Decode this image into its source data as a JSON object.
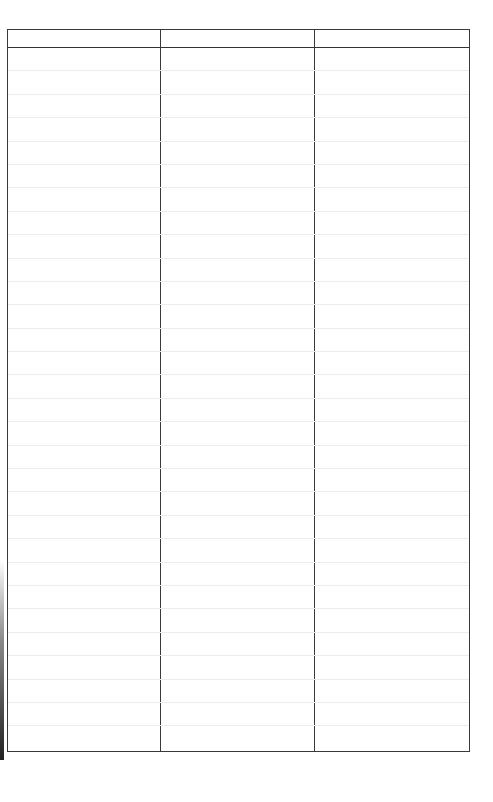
{
  "document": {
    "type": "blank ruled table form",
    "columns": [
      {
        "header": "",
        "width_px": 153
      },
      {
        "header": "",
        "width_px": 155
      },
      {
        "header": "",
        "width_px": 155
      }
    ],
    "row_count": 30,
    "rows": [
      [
        "",
        "",
        ""
      ],
      [
        "",
        "",
        ""
      ],
      [
        "",
        "",
        ""
      ],
      [
        "",
        "",
        ""
      ],
      [
        "",
        "",
        ""
      ],
      [
        "",
        "",
        ""
      ],
      [
        "",
        "",
        ""
      ],
      [
        "",
        "",
        ""
      ],
      [
        "",
        "",
        ""
      ],
      [
        "",
        "",
        ""
      ],
      [
        "",
        "",
        ""
      ],
      [
        "",
        "",
        ""
      ],
      [
        "",
        "",
        ""
      ],
      [
        "",
        "",
        ""
      ],
      [
        "",
        "",
        ""
      ],
      [
        "",
        "",
        ""
      ],
      [
        "",
        "",
        ""
      ],
      [
        "",
        "",
        ""
      ],
      [
        "",
        "",
        ""
      ],
      [
        "",
        "",
        ""
      ],
      [
        "",
        "",
        ""
      ],
      [
        "",
        "",
        ""
      ],
      [
        "",
        "",
        ""
      ],
      [
        "",
        "",
        ""
      ],
      [
        "",
        "",
        ""
      ],
      [
        "",
        "",
        ""
      ],
      [
        "",
        "",
        ""
      ],
      [
        "",
        "",
        ""
      ],
      [
        "",
        "",
        ""
      ],
      [
        "",
        "",
        ""
      ]
    ],
    "colors": {
      "border": "#3a3a3a",
      "rule": "#ececec",
      "background": "#ffffff"
    }
  }
}
